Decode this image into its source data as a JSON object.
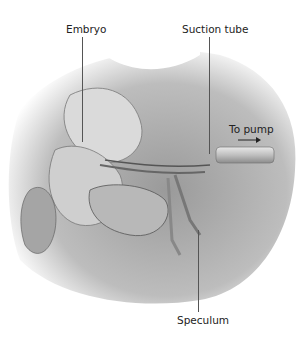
{
  "diagram": {
    "labels": {
      "embryo": "Embryo",
      "suction_tube": "Suction tube",
      "to_pump": "To pump",
      "speculum": "Speculum"
    },
    "arrow": "→"
  }
}
